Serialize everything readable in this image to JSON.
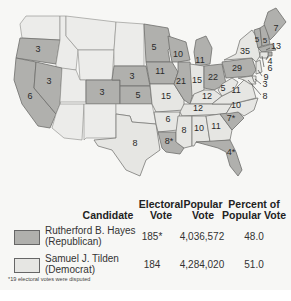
{
  "map": {
    "title": "Election of 1876",
    "colors": {
      "republican": "#b0b0ad",
      "democrat": "#e6e6e3",
      "territory": "#ececea"
    },
    "states": [
      {
        "name": "Oregon",
        "votes": "3",
        "party": "republican"
      },
      {
        "name": "California",
        "votes": "6",
        "party": "republican"
      },
      {
        "name": "Nevada",
        "votes": "3",
        "party": "republican"
      },
      {
        "name": "Colorado",
        "votes": "3",
        "party": "republican"
      },
      {
        "name": "Nebraska",
        "votes": "3",
        "party": "republican"
      },
      {
        "name": "Kansas",
        "votes": "5",
        "party": "republican"
      },
      {
        "name": "Texas",
        "votes": "8",
        "party": "democrat"
      },
      {
        "name": "Minnesota",
        "votes": "5",
        "party": "republican"
      },
      {
        "name": "Iowa",
        "votes": "11",
        "party": "republican"
      },
      {
        "name": "Missouri",
        "votes": "15",
        "party": "democrat"
      },
      {
        "name": "Arkansas",
        "votes": "6",
        "party": "democrat"
      },
      {
        "name": "Louisiana",
        "votes": "8*",
        "party": "republican"
      },
      {
        "name": "Wisconsin",
        "votes": "10",
        "party": "republican"
      },
      {
        "name": "Illinois",
        "votes": "21",
        "party": "republican"
      },
      {
        "name": "Michigan",
        "votes": "11",
        "party": "republican"
      },
      {
        "name": "Indiana",
        "votes": "15",
        "party": "democrat"
      },
      {
        "name": "Ohio",
        "votes": "22",
        "party": "republican"
      },
      {
        "name": "Kentucky",
        "votes": "12",
        "party": "democrat"
      },
      {
        "name": "Tennessee",
        "votes": "12",
        "party": "democrat"
      },
      {
        "name": "Mississippi",
        "votes": "8",
        "party": "democrat"
      },
      {
        "name": "Alabama",
        "votes": "10",
        "party": "democrat"
      },
      {
        "name": "Georgia",
        "votes": "11",
        "party": "democrat"
      },
      {
        "name": "Florida",
        "votes": "4*",
        "party": "republican"
      },
      {
        "name": "South Carolina",
        "votes": "7*",
        "party": "republican"
      },
      {
        "name": "North Carolina",
        "votes": "10",
        "party": "democrat"
      },
      {
        "name": "Virginia",
        "votes": "11",
        "party": "democrat"
      },
      {
        "name": "West Virginia",
        "votes": "5",
        "party": "democrat"
      },
      {
        "name": "Pennsylvania",
        "votes": "29",
        "party": "republican"
      },
      {
        "name": "New York",
        "votes": "35",
        "party": "democrat"
      },
      {
        "name": "Vermont",
        "votes": "5",
        "party": "republican"
      },
      {
        "name": "New Hampshire",
        "votes": "5",
        "party": "republican"
      },
      {
        "name": "Maine",
        "votes": "7",
        "party": "republican"
      },
      {
        "name": "Massachusetts",
        "votes": "13",
        "party": "republican"
      },
      {
        "name": "Rhode Island",
        "votes": "4",
        "party": "republican"
      },
      {
        "name": "Connecticut",
        "votes": "6",
        "party": "democrat"
      },
      {
        "name": "New Jersey",
        "votes": "9",
        "party": "democrat"
      },
      {
        "name": "Delaware",
        "votes": "3",
        "party": "democrat"
      },
      {
        "name": "Maryland",
        "votes": "8",
        "party": "democrat"
      }
    ]
  },
  "legend": {
    "headers": {
      "candidate": "Candidate",
      "electoral_1": "Electoral",
      "electoral_2": "Vote",
      "popular_1": "Popular",
      "popular_2": "Vote",
      "percent_1": "Percent of",
      "percent_2": "Popular Vote"
    },
    "rows": [
      {
        "name": "Rutherford B. Hayes",
        "party": "(Republican)",
        "electoral": "185*",
        "popular": "4,036,572",
        "percent": "48.0",
        "color": "#b0b0ad"
      },
      {
        "name": "Samuel J. Tilden",
        "party": "(Democrat)",
        "electoral": "184",
        "popular": "4,284,020",
        "percent": "51.0",
        "color": "#e6e6e3"
      }
    ],
    "footnote": "*19 electoral votes were disputed"
  }
}
